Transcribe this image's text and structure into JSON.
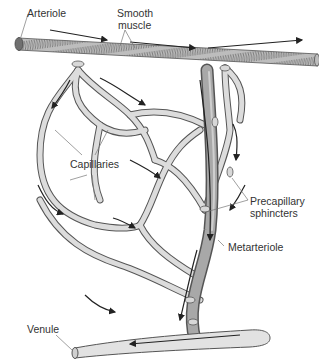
{
  "diagram": {
    "labels": {
      "arteriole": "Arteriole",
      "smooth_muscle_line1": "Smooth",
      "smooth_muscle_line2": "muscle",
      "capillaries": "Capillaries",
      "precapillary_line1": "Precapillary",
      "precapillary_line2": "sphincters",
      "metarteriole": "Metarteriole",
      "venule": "Venule"
    },
    "colors": {
      "vessel_fill": "#d9d9d9",
      "vessel_outline": "#555555",
      "metarteriole_fill": "#a8a8a8",
      "arteriole_band": "#8c8c8c",
      "arteriole_cap": "#707070",
      "arrow": "#222222",
      "leader_line": "#777777",
      "label_text": "#333333"
    },
    "flow_direction": {
      "arteriole": "left-to-right",
      "metarteriole": "top-to-bottom",
      "venule": "right-to-left"
    }
  }
}
